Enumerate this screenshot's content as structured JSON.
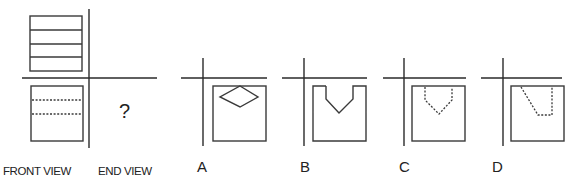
{
  "diagram": {
    "question_mark": "?",
    "labels": {
      "front_view": "FRONT VIEW",
      "end_view": "END VIEW"
    },
    "options": [
      {
        "label": "A",
        "shape": "solid diamond near top"
      },
      {
        "label": "B",
        "shape": "solid V-notch cut at top"
      },
      {
        "label": "C",
        "shape": "dashed V-notch at top"
      },
      {
        "label": "D",
        "shape": "dashed slanted notch at top"
      }
    ]
  }
}
